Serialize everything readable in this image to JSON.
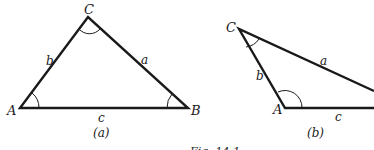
{
  "figure": {
    "caption_partial": "Fig. 14-1",
    "panels": [
      {
        "id": "a",
        "caption": "(a)",
        "vertices": {
          "A": "A",
          "B": "B",
          "C": "C"
        },
        "sides": {
          "a": "a",
          "b": "b",
          "c": "c"
        },
        "points": {
          "A": [
            20,
            108
          ],
          "B": [
            188,
            108
          ],
          "C": [
            88,
            17
          ]
        }
      },
      {
        "id": "b",
        "caption": "(b)",
        "vertices": {
          "A": "A",
          "C": "C"
        },
        "sides": {
          "a": "a",
          "b": "b",
          "c": "c"
        },
        "points": {
          "A": [
            285,
            108
          ],
          "B": [
            374,
            108
          ],
          "C": [
            239,
            29
          ]
        }
      }
    ],
    "line_color": "#1a1a1a"
  }
}
